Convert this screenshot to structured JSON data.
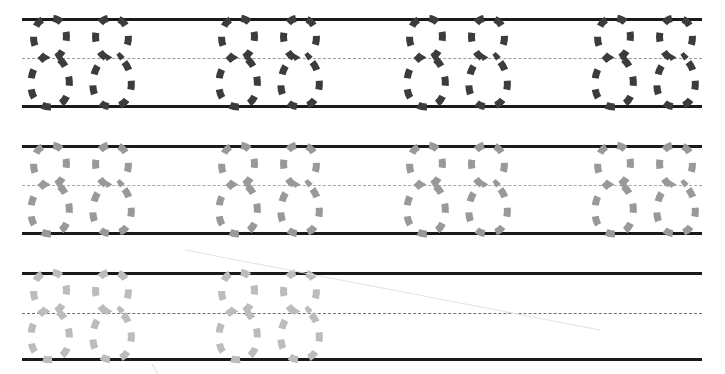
{
  "worksheet": {
    "title": "Number 8 tracing practice worksheet",
    "character": "8",
    "character_name": "digit-eight",
    "width": 725,
    "height": 374,
    "background_color": "#ffffff",
    "line_colors": {
      "solid_rule": "#1a1a1a",
      "dashed_midline": "#9a9a9a",
      "dashed_midline_row3": "#6f6f6f"
    },
    "rows": [
      {
        "id": "row-1",
        "label": "Row 1 - darkest trace guides",
        "top_line_y": 18,
        "mid_line_y": 58,
        "base_line_y": 105,
        "line_left_x": 22,
        "line_right_x": 702,
        "solid_line_thickness": 3,
        "mid_line_thickness": 1,
        "mid_line_color": "#9a9a9a",
        "glyph_color": "#3c3c3c",
        "glyph_stroke_width": 7,
        "glyph_dash": "9 11",
        "glyph_count": 8,
        "groups": 4,
        "glyph_x_positions": [
          24,
          86,
          212,
          274,
          400,
          462,
          588,
          650
        ],
        "glyph_width": 52,
        "trailing_glyph_clipped": true
      },
      {
        "id": "row-2",
        "label": "Row 2 - medium grey trace guides",
        "top_line_y": 145,
        "mid_line_y": 185,
        "base_line_y": 232,
        "line_left_x": 22,
        "line_right_x": 702,
        "solid_line_thickness": 3,
        "mid_line_thickness": 1,
        "mid_line_color": "#a8a8a8",
        "glyph_color": "#999999",
        "glyph_stroke_width": 7,
        "glyph_dash": "9 11",
        "glyph_count": 8,
        "groups": 4,
        "glyph_x_positions": [
          24,
          86,
          212,
          274,
          400,
          462,
          588,
          650
        ],
        "glyph_width": 52,
        "trailing_glyph_clipped": true
      },
      {
        "id": "row-3",
        "label": "Row 3 - lightest trace guides then blank practice space",
        "top_line_y": 272,
        "mid_line_y": 313,
        "base_line_y": 358,
        "line_left_x": 22,
        "line_right_x": 702,
        "solid_line_thickness": 3,
        "mid_line_thickness": 1,
        "mid_line_color": "#6f6f6f",
        "glyph_color": "#bcbcbc",
        "glyph_stroke_width": 7,
        "glyph_dash": "9 11",
        "glyph_count": 4,
        "groups": 2,
        "glyph_x_positions": [
          24,
          86,
          212,
          274
        ],
        "glyph_width": 52,
        "trailing_glyph_clipped": false,
        "blank_practice_space": true
      }
    ],
    "artifacts": [
      {
        "id": "scan-streak",
        "name": "diagonal-scan-streak",
        "x1": 185,
        "y1": 250,
        "x2": 600,
        "y2": 330,
        "color": "#e2e2e2"
      },
      {
        "id": "scan-tick",
        "name": "scan-speck",
        "x1": 152,
        "y1": 364,
        "x2": 158,
        "y2": 374,
        "color": "#dcdcdc"
      }
    ]
  }
}
